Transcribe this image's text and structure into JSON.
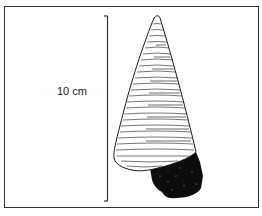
{
  "figure": {
    "scale_bar": {
      "label": "10 cm",
      "orientation": "vertical"
    },
    "colors": {
      "ink": "#1a1a1a",
      "border": "#333333",
      "background": "#ffffff",
      "base_fill": "#0d0d0d"
    }
  }
}
